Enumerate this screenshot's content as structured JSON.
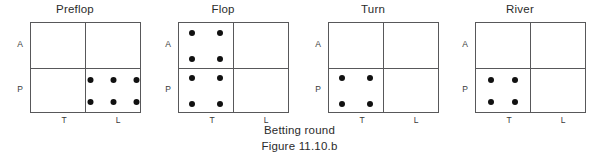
{
  "chart_data": {
    "type": "table",
    "title": "Betting round",
    "figure_label": "Figure 11.10.b",
    "xlabel": "",
    "ylabel": "",
    "row_labels": [
      "A",
      "P"
    ],
    "column_labels": [
      "T",
      "L"
    ],
    "grid": true,
    "legend": "none",
    "panels": [
      {
        "label": "Preflop",
        "cells": [
          {
            "row": "A",
            "col": "T",
            "count": 0,
            "rows": 0,
            "cols": 0
          },
          {
            "row": "A",
            "col": "L",
            "count": 0,
            "rows": 0,
            "cols": 0
          },
          {
            "row": "P",
            "col": "T",
            "count": 0,
            "rows": 0,
            "cols": 0
          },
          {
            "row": "P",
            "col": "L",
            "count": 6,
            "rows": 2,
            "cols": 3
          }
        ]
      },
      {
        "label": "Flop",
        "cells": [
          {
            "row": "A",
            "col": "T",
            "count": 4,
            "rows": 2,
            "cols": 2
          },
          {
            "row": "A",
            "col": "L",
            "count": 0,
            "rows": 0,
            "cols": 0
          },
          {
            "row": "P",
            "col": "T",
            "count": 4,
            "rows": 2,
            "cols": 2
          },
          {
            "row": "P",
            "col": "L",
            "count": 0,
            "rows": 0,
            "cols": 0
          }
        ]
      },
      {
        "label": "Turn",
        "cells": [
          {
            "row": "A",
            "col": "T",
            "count": 0,
            "rows": 0,
            "cols": 0
          },
          {
            "row": "A",
            "col": "L",
            "count": 0,
            "rows": 0,
            "cols": 0
          },
          {
            "row": "P",
            "col": "T",
            "count": 4,
            "rows": 2,
            "cols": 2
          },
          {
            "row": "P",
            "col": "L",
            "count": 0,
            "rows": 0,
            "cols": 0
          }
        ]
      },
      {
        "label": "River",
        "cells": [
          {
            "row": "A",
            "col": "T",
            "count": 0,
            "rows": 0,
            "cols": 0
          },
          {
            "row": "A",
            "col": "L",
            "count": 0,
            "rows": 0,
            "cols": 0
          },
          {
            "row": "P",
            "col": "T",
            "count": 4,
            "rows": 2,
            "cols": 2
          },
          {
            "row": "P",
            "col": "L",
            "count": 0,
            "rows": 0,
            "cols": 0
          }
        ]
      }
    ],
    "colors": {
      "dot": "#111111",
      "grid_line": "#58585a",
      "text": "#2b2b2b",
      "background": "#ffffff"
    }
  },
  "caption": {
    "line1": "Betting round",
    "line2": "Figure 11.10.b"
  }
}
